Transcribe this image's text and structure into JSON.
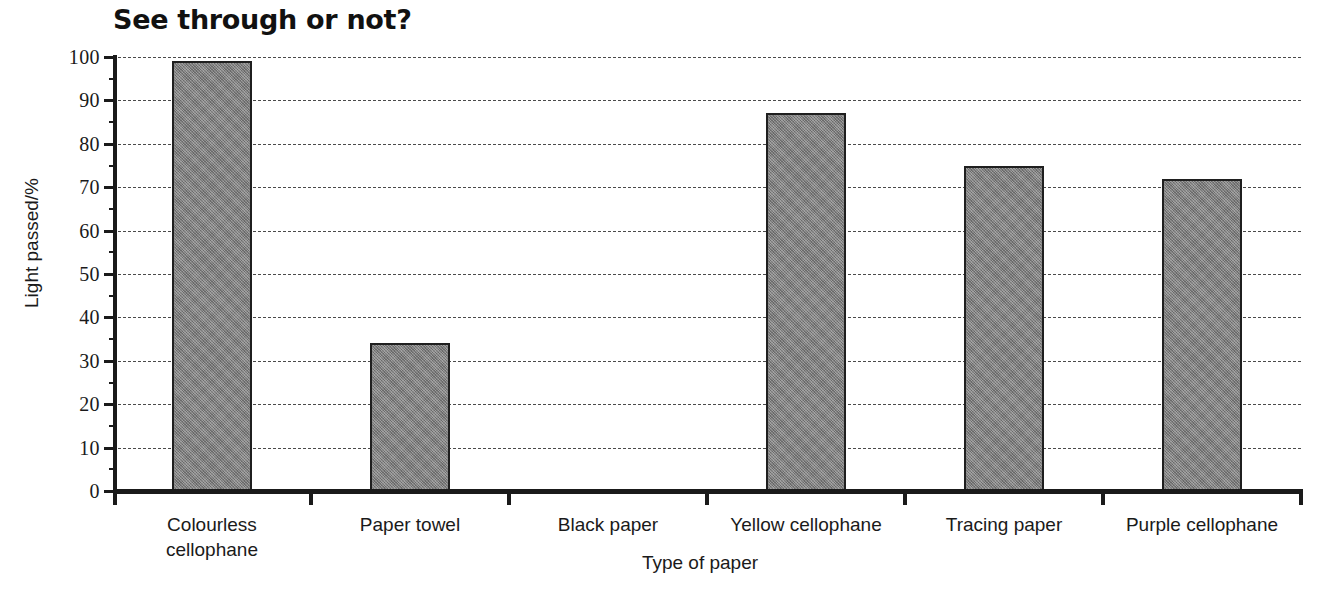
{
  "chart_data": {
    "type": "bar",
    "title": "See through or not?",
    "xlabel": "Type of paper",
    "ylabel": "Light passed/%",
    "categories": [
      "Colourless cellophane",
      "Paper towel",
      "Black paper",
      "Yellow cellophane",
      "Tracing paper",
      "Purple cellophane"
    ],
    "category_lines": [
      [
        "Colourless",
        "cellophane"
      ],
      [
        "Paper towel"
      ],
      [
        "Black paper"
      ],
      [
        "Yellow cellophane"
      ],
      [
        "Tracing paper"
      ],
      [
        "Purple cellophane"
      ]
    ],
    "values": [
      99,
      34,
      0,
      87,
      75,
      72
    ],
    "ylim": [
      0,
      100
    ],
    "ytick_step": 10,
    "yticks": [
      0,
      10,
      20,
      30,
      40,
      50,
      60,
      70,
      80,
      90,
      100
    ],
    "ytick_labels": [
      "0",
      "10",
      "20",
      "30",
      "40",
      "50",
      "60",
      "70",
      "80",
      "90",
      "100"
    ],
    "grid": true,
    "grid_style": "dashed",
    "legend": null,
    "colors": {
      "bar_fill": "#808080",
      "bar_border": "#1f1f1f",
      "axis": "#1a1a1a",
      "gridline": "#4a4a4a",
      "background": "#ffffff",
      "title": "#111111"
    }
  }
}
